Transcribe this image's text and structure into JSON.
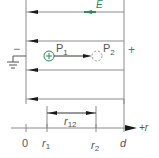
{
  "diagram": {
    "field_label": "E",
    "left_plate_sign": "−",
    "right_plate_sign": "+",
    "point1_label": "P",
    "point1_sub": "1",
    "point2_label": "P",
    "point2_sub": "2",
    "charge_symbol": "+",
    "distance_label": "r",
    "distance_sub": "12",
    "axis_label": "+r",
    "ticks": [
      {
        "label": "0",
        "sub": ""
      },
      {
        "label": "r",
        "sub": "1"
      },
      {
        "label": "r",
        "sub": "2"
      },
      {
        "label": "d",
        "sub": ""
      }
    ],
    "colors": {
      "line": "#8a8a8a",
      "arrow": "#1a1a1a",
      "accent": "#2e8b57",
      "text": "#555555"
    }
  }
}
